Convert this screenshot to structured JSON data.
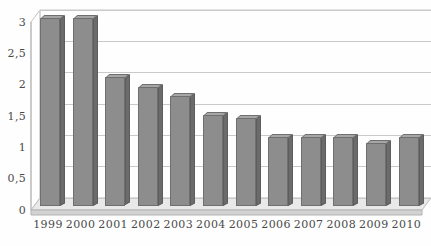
{
  "chart_data": {
    "type": "bar",
    "title": "",
    "subtitle": "",
    "xlabel": "",
    "ylabel": "",
    "categories": [
      "1999",
      "2000",
      "2001",
      "2002",
      "2003",
      "2004",
      "2005",
      "2006",
      "2007",
      "2008",
      "2009",
      "2010"
    ],
    "values": [
      3.0,
      3.0,
      2.05,
      1.9,
      1.75,
      1.45,
      1.4,
      1.1,
      1.1,
      1.1,
      1.0,
      1.1
    ],
    "ylim": [
      0,
      3
    ],
    "ytick_labels": [
      "0",
      "0,5",
      "1",
      "1,5",
      "2",
      "2,5",
      "3"
    ],
    "ytick_values": [
      0,
      0.5,
      1,
      1.5,
      2,
      2.5,
      3
    ],
    "grid": true,
    "legend": null,
    "legend_position": "none",
    "style": "3d-column",
    "annotations": []
  },
  "colors": {
    "bar_face": "#8d8d8d",
    "bar_side": "#6b6b6b",
    "bar_top": "#a6a6a6",
    "bar_outline": "#6f6f6f",
    "gridline": "#c9c9c9",
    "axis_text": "#4a4a4a",
    "background": "#fefefe",
    "floor": "#d8d8d8"
  }
}
